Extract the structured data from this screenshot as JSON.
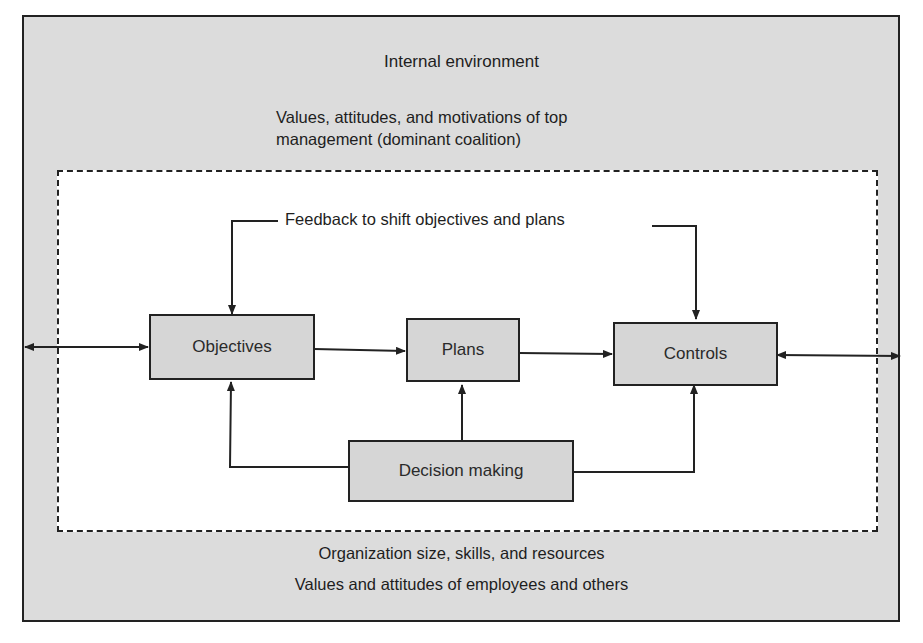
{
  "diagram": {
    "outer_label": "Internal environment",
    "top_context": {
      "line1": "Values, attitudes, and motivations of top",
      "line2": "management (dominant coalition)"
    },
    "feedback_label": "Feedback to shift objectives and plans",
    "nodes": {
      "objectives": "Objectives",
      "plans": "Plans",
      "controls": "Controls",
      "decision_making": "Decision making"
    },
    "bottom_context": {
      "line1": "Organization size, skills, and resources",
      "line2": "Values and attitudes of employees and others"
    },
    "edges": [
      {
        "from": "external-left",
        "to": "objectives",
        "type": "bidirectional"
      },
      {
        "from": "objectives",
        "to": "plans",
        "type": "directed"
      },
      {
        "from": "plans",
        "to": "controls",
        "type": "directed"
      },
      {
        "from": "controls",
        "to": "external-right",
        "type": "bidirectional"
      },
      {
        "from": "feedback",
        "to": "objectives",
        "type": "directed"
      },
      {
        "from": "feedback",
        "to": "controls",
        "type": "directed"
      },
      {
        "from": "decision_making",
        "to": "objectives",
        "type": "directed"
      },
      {
        "from": "decision_making",
        "to": "plans",
        "type": "directed"
      },
      {
        "from": "decision_making",
        "to": "controls",
        "type": "directed"
      }
    ],
    "colors": {
      "environment_fill": "#dcdcdc",
      "box_fill": "#d6d6d6",
      "line": "#222222"
    }
  }
}
